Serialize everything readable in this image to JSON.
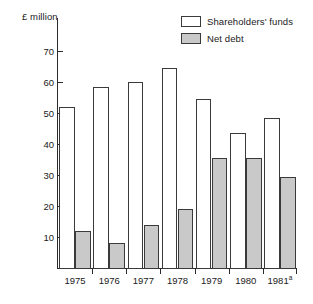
{
  "chart_data": {
    "type": "bar",
    "title": "",
    "subtitle": "",
    "xlabel": "",
    "ylabel": "£ million",
    "unit_label": "£ million",
    "categories": [
      "1975",
      "1976",
      "1977",
      "1978",
      "1979",
      "1980",
      "1981"
    ],
    "category_labels": [
      "1975",
      "1976",
      "1977",
      "1978",
      "1979",
      "1980",
      "1981"
    ],
    "category_footnotes": [
      "",
      "",
      "",
      "",
      "",
      "",
      "a"
    ],
    "series": [
      {
        "name": "Shareholders' funds",
        "color": "#ffffff",
        "values": [
          52,
          58.5,
          60,
          64.5,
          54.5,
          43.5,
          48.5
        ]
      },
      {
        "name": "Net debt",
        "color": "#c9c9c9",
        "values": [
          12,
          8,
          14,
          19,
          35.5,
          35.5,
          29.3
        ]
      }
    ],
    "ylim": [
      0,
      75
    ],
    "yticks": [
      10,
      20,
      30,
      40,
      50,
      60,
      70
    ],
    "ytick_labels": [
      "10",
      "20",
      "30",
      "40",
      "50",
      "60",
      "70"
    ],
    "grid": false,
    "legend_position": "top-right",
    "grouped": true,
    "bar_border_color": "#3a3a3a",
    "axis_color": "#2b2b2b"
  },
  "legend": {
    "entries": [
      {
        "label": "Shareholders' funds",
        "swatch": "white-swatch"
      },
      {
        "label": "Net debt",
        "swatch": "gray-swatch"
      }
    ]
  }
}
